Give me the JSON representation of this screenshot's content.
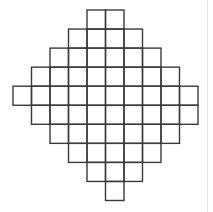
{
  "figure": {
    "type": "square-grid-diamond",
    "line_color": "#3a3a3a",
    "background": "#ffffff",
    "origin_x": 13,
    "origin_y": 10,
    "cell_w": 18.5,
    "cell_h": 19.05,
    "rows": [
      {
        "start": 4,
        "end": 6
      },
      {
        "start": 3,
        "end": 7
      },
      {
        "start": 2,
        "end": 8
      },
      {
        "start": 1,
        "end": 9
      },
      {
        "start": 0,
        "end": 10
      },
      {
        "start": 1,
        "end": 10
      },
      {
        "start": 2,
        "end": 9
      },
      {
        "start": 3,
        "end": 8
      },
      {
        "start": 4,
        "end": 7
      },
      {
        "start": 5,
        "end": 6
      }
    ],
    "row_cell_counts": [
      2,
      4,
      6,
      8,
      10,
      9,
      7,
      5,
      3,
      1
    ],
    "total_cells": 55
  }
}
